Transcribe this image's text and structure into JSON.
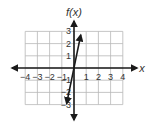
{
  "chart_data": {
    "type": "line",
    "title": "",
    "xlabel": "x",
    "ylabel": "f(x)",
    "xlim": [
      -4,
      4
    ],
    "ylim": [
      -3,
      3
    ],
    "grid": true,
    "x_ticks": [
      "-4",
      "-3",
      "-2",
      "-1",
      "1",
      "2",
      "3",
      "4"
    ],
    "y_ticks": [
      "3",
      "2",
      "1",
      "-1",
      "-2",
      "-3"
    ],
    "series": [
      {
        "name": "f(x)",
        "x": [
          -0.6,
          0.55
        ],
        "y": [
          -2.9,
          2.7
        ],
        "arrows_both_ends": true
      }
    ]
  },
  "labels": {
    "y_axis": "f(x)",
    "x_axis": "x"
  },
  "colors": {
    "grid": "#b8b8b8",
    "axis": "#1a1a1a",
    "line": "#1a1a1a"
  }
}
